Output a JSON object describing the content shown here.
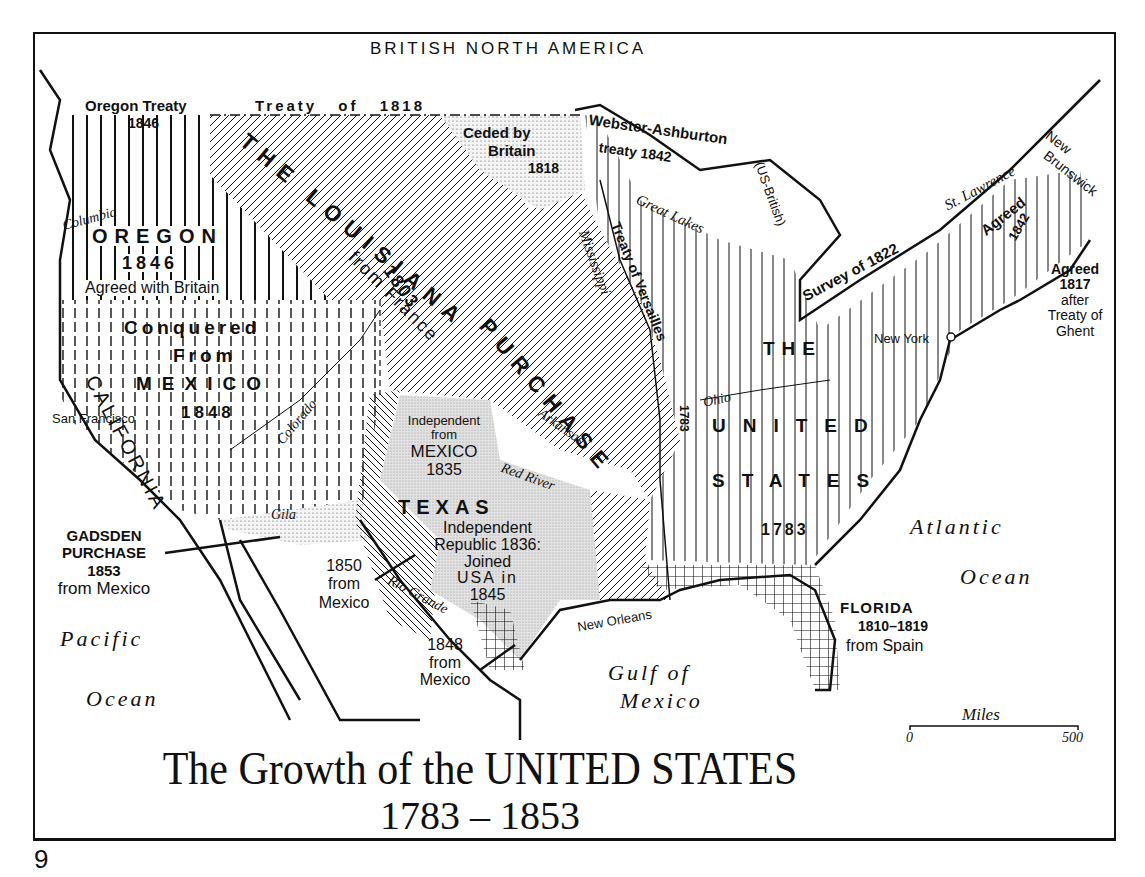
{
  "map": {
    "title_line1": "The Growth of the UNITED STATES",
    "title_line2": "1783 – 1853",
    "page_number": "9",
    "top_label": "BRITISH NORTH AMERICA",
    "territories": {
      "oregon": {
        "name": "OREGON",
        "year": "1846",
        "note": "Agreed with Britain",
        "treaty": "Oregon Treaty",
        "treaty_year": "1846"
      },
      "treaty_1818": {
        "label": "Treaty of 1818"
      },
      "ceded_britain": {
        "line1": "Ceded by",
        "line2": "Britain",
        "line3": "1818"
      },
      "louisiana": {
        "line1": "THE LOUISIANA",
        "line2": "PURCHASE",
        "year": "1803",
        "from": "from France"
      },
      "mexican_cession": {
        "line1": "Conquered",
        "line2": "From",
        "line3": "MEXICO",
        "year": "1848",
        "region": "CALIFORNIA"
      },
      "texas": {
        "name": "TEXAS",
        "ind1": "Independent",
        "ind2": "from",
        "ind3": "MEXICO",
        "ind_year": "1835",
        "rep1": "Independent",
        "rep2": "Republic 1836:",
        "rep3": "Joined",
        "rep4": "USA in",
        "rep5": "1845"
      },
      "gadsden": {
        "line1": "GADSDEN",
        "line2": "PURCHASE",
        "year": "1853",
        "from": "from Mexico"
      },
      "from_mexico_1850": {
        "line1": "1850",
        "line2": "from",
        "line3": "Mexico"
      },
      "from_mexico_1848": {
        "line1": "1848",
        "line2": "from",
        "line3": "Mexico"
      },
      "united_states": {
        "line1": "THE",
        "line2": "UNITED",
        "line3": "STATES",
        "year": "1783"
      },
      "florida": {
        "name": "FLORIDA",
        "years": "1810–1819",
        "from": "from Spain"
      },
      "webster": {
        "line1": "Webster-Ashburton",
        "line2": "treaty 1842",
        "note": "(US-British)"
      },
      "survey_1822": {
        "label": "Survey of 1822"
      },
      "agreed_1842": {
        "line1": "Agreed",
        "line2": "1842"
      },
      "agreed_1817": {
        "line1": "Agreed",
        "line2": "1817",
        "line3": "after",
        "line4": "Treaty of",
        "line5": "Ghent"
      },
      "versailles": {
        "line1": "Treaty",
        "line2": "of Versailles",
        "year": "1783"
      },
      "new_brunswick": {
        "line1": "New",
        "line2": "Brunswick"
      }
    },
    "rivers": [
      "Columbia",
      "Colorado",
      "Gila",
      "Mississippi",
      "Arkansas",
      "Red River",
      "Rio Grande",
      "Ohio",
      "St. Lawrence",
      "Great Lakes"
    ],
    "cities": [
      "San Francisco",
      "New Orleans",
      "New York"
    ],
    "oceans": {
      "pacific1": "Pacific",
      "pacific2": "Ocean",
      "atlantic1": "Atlantic",
      "atlantic2": "Ocean",
      "gulf1": "Gulf of",
      "gulf2": "Mexico"
    },
    "scale": {
      "label": "Miles",
      "min": "0",
      "max": "500"
    }
  }
}
